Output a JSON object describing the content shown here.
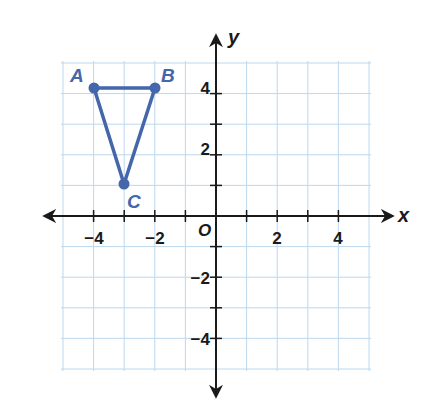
{
  "diagram": {
    "type": "coordinate-plane",
    "grid": {
      "xmin": -5,
      "xmax": 5,
      "ymin": -5,
      "ymax": 5,
      "step": 1,
      "color": "#bcd8ee"
    },
    "axes": {
      "x_label": "x",
      "y_label": "y",
      "origin_label": "O",
      "color": "#1a1a1a",
      "x_ticks": [
        {
          "value": -4,
          "label": "−4"
        },
        {
          "value": -2,
          "label": "−2"
        },
        {
          "value": 2,
          "label": "2"
        },
        {
          "value": 4,
          "label": "4"
        }
      ],
      "y_ticks": [
        {
          "value": 4,
          "label": "4"
        },
        {
          "value": 2,
          "label": "2"
        },
        {
          "value": -2,
          "label": "−2"
        },
        {
          "value": -4,
          "label": "−4"
        }
      ]
    },
    "triangle": {
      "color": "#4466aa",
      "vertices": [
        {
          "name": "A",
          "x": -4,
          "y": 4
        },
        {
          "name": "B",
          "x": -2,
          "y": 4
        },
        {
          "name": "C",
          "x": -3,
          "y": 1
        }
      ]
    }
  }
}
